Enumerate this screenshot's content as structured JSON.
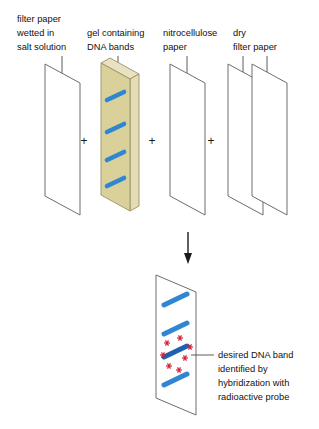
{
  "figure": {
    "colors": {
      "gel_fill": "#d9d09a",
      "gel_edge": "#b5ab75",
      "gel_side": "#e3dcb4",
      "band_blue": "#2f86d2",
      "band_blue_dark": "#1f5fae",
      "star_red": "#d6213c",
      "outline_gray": "#6d6d6d",
      "text_black": "#111111"
    }
  },
  "labels": {
    "filter_paper_wetted": {
      "line1": "filter paper",
      "line2": "wetted in",
      "line3": "salt solution"
    },
    "gel": {
      "line1": "gel containing",
      "line2": "DNA bands"
    },
    "nitrocellulose": {
      "line1": "nitrocellulose",
      "line2": "paper"
    },
    "dry_filter": {
      "line1": "dry",
      "line2": "filter paper"
    },
    "result_caption": {
      "line1": "desired DNA band",
      "line2": "identified by",
      "line3": "hybridization with",
      "line4": "radioactive probe"
    }
  },
  "operators": {
    "plus1": "+",
    "plus2": "+",
    "plus3": "+"
  },
  "components": [
    {
      "name": "filter-paper-wetted-sheet",
      "kind": "plain-sheet",
      "bands": 0
    },
    {
      "name": "gel-slab",
      "kind": "gel-3d",
      "bands": 4
    },
    {
      "name": "nitrocellulose-sheet",
      "kind": "plain-sheet",
      "bands": 0
    },
    {
      "name": "dry-filter-sheet-front",
      "kind": "plain-sheet",
      "bands": 0
    },
    {
      "name": "dry-filter-sheet-back",
      "kind": "plain-sheet",
      "bands": 0
    }
  ],
  "result": {
    "name": "blotted-nitrocellulose-sheet",
    "band_count": 4,
    "highlighted_band_index": 3,
    "star_count": 7
  },
  "arrow": {
    "name": "downward-process-arrow",
    "direction": "down"
  }
}
